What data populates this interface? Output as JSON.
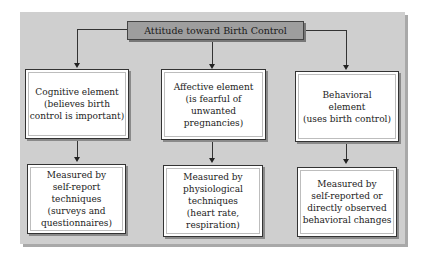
{
  "diagram": {
    "title": "Attitude toward Birth Control",
    "components": [
      {
        "element": "Cognitive element\n(believes birth\ncontrol is important)",
        "measure": "Measured by\nself-report\ntechniques\n(surveys and\nquestionnaires)"
      },
      {
        "element": "Affective element\n(is fearful of\nunwanted\npregnancies)",
        "measure": "Measured by\nphysiological\ntechniques\n(heart rate,\nrespiration)"
      },
      {
        "element": "Behavioral\nelement\n(uses birth control)",
        "measure": "Measured by\nself-reported or\ndirectly observed\nbehavioral changes"
      }
    ]
  },
  "colors": {
    "panel": "#cfcfcf",
    "title_box": "#9e9e9e",
    "box": "#ffffff",
    "line": "#333333"
  }
}
